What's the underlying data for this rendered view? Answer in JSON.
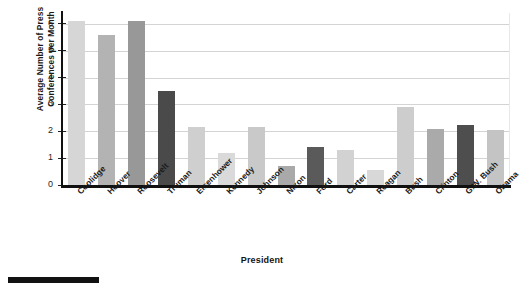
{
  "chart_data": {
    "type": "bar",
    "title": "",
    "xlabel": "President",
    "ylabel": "Average Number of Press Conferences per Month",
    "ylabel_line1": "Average Number of Press",
    "ylabel_line2": "Conferences per Month",
    "categories": [
      "Coolidge",
      "Hoover",
      "Roosevelt",
      "Truman",
      "Eisenhower",
      "Kennedy",
      "Johnson",
      "Nixon",
      "Ford",
      "Carter",
      "Reagan",
      "Bush",
      "Clinton",
      "G.W. Bush",
      "Obama"
    ],
    "values": [
      6.1,
      5.6,
      6.1,
      3.5,
      2.15,
      1.2,
      2.15,
      0.7,
      1.4,
      1.3,
      0.55,
      2.9,
      2.1,
      2.25,
      2.05
    ],
    "bar_colors": [
      "#d6d6d6",
      "#b3b3b3",
      "#989898",
      "#4a4a4a",
      "#cfcfcf",
      "#dadada",
      "#c9c9c9",
      "#a9a9a9",
      "#5a5a5a",
      "#d2d2d2",
      "#d8d8d8",
      "#cdcdcd",
      "#aaaaaa",
      "#4e4e4e",
      "#c4c4c4"
    ],
    "ylim": [
      0,
      6.4
    ],
    "yticks": [
      0,
      1,
      2,
      3,
      4,
      5,
      6
    ],
    "ytick_labels": [
      "0",
      "1",
      "2",
      "3",
      "4",
      "5",
      "6"
    ],
    "grid": true,
    "grid_color": "#d4d4d4",
    "legend": null,
    "legend_position": "none",
    "axis_color": "#111111",
    "background": "#ffffff"
  }
}
